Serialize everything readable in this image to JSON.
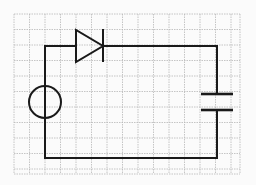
{
  "diagram": {
    "type": "circuit-schematic",
    "background": "#fbfbfb",
    "grid": {
      "color": "#b8b8b8",
      "x0": 14,
      "y0": 14,
      "x1": 240,
      "y1": 174,
      "spacing": 15.5
    },
    "wire_color": "#1a1a1a",
    "components": [
      {
        "name": "ac-source",
        "symbol": "circle",
        "cx": 45,
        "cy": 102,
        "r": 16
      },
      {
        "name": "diode",
        "symbol": "diode",
        "anode_x": 76,
        "cathode_x": 103,
        "y": 46,
        "half_height": 16
      },
      {
        "name": "capacitor",
        "symbol": "capacitor",
        "x": 217,
        "plate_top_y": 94,
        "plate_bottom_y": 110,
        "half_width": 16
      }
    ],
    "wires": {
      "left_x": 45,
      "right_x": 266,
      "top_y": 46,
      "bottom_y": 158,
      "right_wire_x": 217
    }
  }
}
